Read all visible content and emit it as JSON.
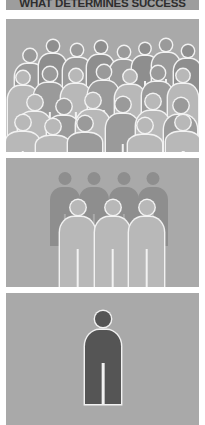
{
  "title": {
    "text": "WHAT DETERMINES SUCCESS",
    "banner_color": "#9d9d9d",
    "text_color": "#2e2e2e"
  },
  "palette": {
    "page_background": "#ffffff",
    "panel_background": "#a9a9a9",
    "figure_back": "#8e8e8e",
    "figure_mid": "#9a9a9a",
    "figure_front": "#b8b8b8",
    "figure_dark": "#555555",
    "outline": "#f2f2f2"
  },
  "panels": [
    {
      "id": "panel-crowd",
      "name": "crowd-panel",
      "caption": "",
      "figure_count": 26,
      "description": "Large dense crowd of pictogram people, many overlapping rows"
    },
    {
      "id": "panel-group",
      "name": "group-panel",
      "caption": "",
      "figure_count": 7,
      "description": "Small group of seven pictogram people, four behind and three in front"
    },
    {
      "id": "panel-single",
      "name": "single-panel",
      "caption": "",
      "figure_count": 1,
      "description": "One dark pictogram person centered alone"
    }
  ],
  "chart_data": {
    "type": "pictogram",
    "title": "WHAT DETERMINES SUCCESS",
    "xlabel": "",
    "ylabel": "",
    "categories": [
      "Crowd",
      "Group",
      "Individual"
    ],
    "values": [
      26,
      7,
      1
    ],
    "unit": "people",
    "legend": [],
    "grid": false,
    "annotations": []
  },
  "crowd_figures": [
    {
      "x": 9,
      "y": 30,
      "h": 74,
      "w": 29,
      "tone": "figure_mid",
      "outlined": true
    },
    {
      "x": 33,
      "y": 21,
      "h": 70,
      "w": 27,
      "tone": "figure_back",
      "outlined": true
    },
    {
      "x": 57,
      "y": 25,
      "h": 72,
      "w": 28,
      "tone": "figure_mid",
      "outlined": true
    },
    {
      "x": 81,
      "y": 22,
      "h": 71,
      "w": 27,
      "tone": "figure_back",
      "outlined": true
    },
    {
      "x": 104,
      "y": 27,
      "h": 70,
      "w": 27,
      "tone": "figure_mid",
      "outlined": true
    },
    {
      "x": 126,
      "y": 24,
      "h": 68,
      "w": 26,
      "tone": "figure_back",
      "outlined": true
    },
    {
      "x": 146,
      "y": 20,
      "h": 72,
      "w": 28,
      "tone": "figure_mid",
      "outlined": true
    },
    {
      "x": 168,
      "y": 26,
      "h": 70,
      "w": 27,
      "tone": "figure_back",
      "outlined": true
    },
    {
      "x": 2,
      "y": 52,
      "h": 78,
      "w": 30,
      "tone": "figure_front",
      "outlined": true
    },
    {
      "x": 28,
      "y": 48,
      "h": 80,
      "w": 31,
      "tone": "figure_mid",
      "outlined": true
    },
    {
      "x": 55,
      "y": 50,
      "h": 78,
      "w": 30,
      "tone": "figure_front",
      "outlined": true
    },
    {
      "x": 82,
      "y": 46,
      "h": 80,
      "w": 31,
      "tone": "figure_mid",
      "outlined": true
    },
    {
      "x": 109,
      "y": 51,
      "h": 78,
      "w": 30,
      "tone": "figure_front",
      "outlined": true
    },
    {
      "x": 136,
      "y": 47,
      "h": 80,
      "w": 31,
      "tone": "figure_mid",
      "outlined": true
    },
    {
      "x": 162,
      "y": 50,
      "h": 78,
      "w": 30,
      "tone": "figure_front",
      "outlined": true
    },
    {
      "x": 12,
      "y": 76,
      "h": 84,
      "w": 33,
      "tone": "figure_front",
      "outlined": true
    },
    {
      "x": 41,
      "y": 80,
      "h": 84,
      "w": 33,
      "tone": "figure_mid",
      "outlined": true
    },
    {
      "x": 70,
      "y": 74,
      "h": 86,
      "w": 34,
      "tone": "figure_front",
      "outlined": true
    },
    {
      "x": 100,
      "y": 78,
      "h": 84,
      "w": 33,
      "tone": "figure_mid",
      "outlined": true
    },
    {
      "x": 130,
      "y": 75,
      "h": 86,
      "w": 34,
      "tone": "figure_front",
      "outlined": true
    },
    {
      "x": 158,
      "y": 79,
      "h": 84,
      "w": 33,
      "tone": "figure_mid",
      "outlined": true
    },
    {
      "x": 0,
      "y": 96,
      "h": 60,
      "w": 33,
      "tone": "figure_front",
      "outlined": true
    },
    {
      "x": 30,
      "y": 100,
      "h": 58,
      "w": 34,
      "tone": "figure_front",
      "outlined": true
    },
    {
      "x": 62,
      "y": 97,
      "h": 60,
      "w": 34,
      "tone": "figure_mid",
      "outlined": true
    },
    {
      "x": 122,
      "y": 99,
      "h": 58,
      "w": 34,
      "tone": "figure_front",
      "outlined": true
    },
    {
      "x": 160,
      "y": 96,
      "h": 60,
      "w": 34,
      "tone": "figure_front",
      "outlined": true
    }
  ],
  "group_figures": [
    {
      "x": 44,
      "y": 14,
      "h": 74,
      "w": 30,
      "tone": "figure_back",
      "outlined": false
    },
    {
      "x": 73,
      "y": 14,
      "h": 74,
      "w": 30,
      "tone": "figure_back",
      "outlined": false
    },
    {
      "x": 103,
      "y": 14,
      "h": 74,
      "w": 30,
      "tone": "figure_back",
      "outlined": false
    },
    {
      "x": 132,
      "y": 14,
      "h": 74,
      "w": 30,
      "tone": "figure_back",
      "outlined": false
    },
    {
      "x": 54,
      "y": 42,
      "h": 88,
      "w": 35,
      "tone": "figure_front",
      "outlined": true
    },
    {
      "x": 89,
      "y": 42,
      "h": 88,
      "w": 35,
      "tone": "figure_front",
      "outlined": true
    },
    {
      "x": 123,
      "y": 42,
      "h": 88,
      "w": 35,
      "tone": "figure_front",
      "outlined": true
    }
  ],
  "single_figures": [
    {
      "x": 79,
      "y": 18,
      "h": 93,
      "w": 36,
      "tone": "figure_dark",
      "outlined": true
    }
  ]
}
